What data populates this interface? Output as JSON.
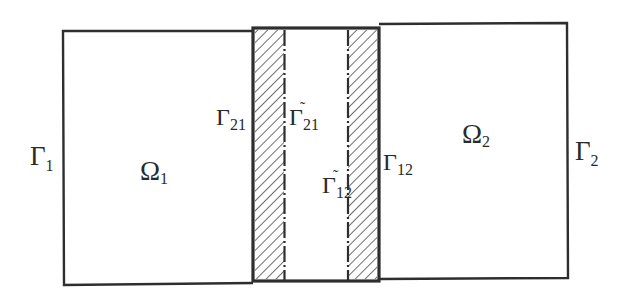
{
  "diagram": {
    "colors": {
      "stroke": "#2e2e2e",
      "hatch": "#4a4a4a",
      "background": "#ffffff",
      "text": "#2a2a2a"
    },
    "regions": {
      "omega1": {
        "symbol": "Ω",
        "subscript": "1"
      },
      "omega2": {
        "symbol": "Ω",
        "subscript": "2"
      }
    },
    "boundaries": {
      "gamma1": {
        "symbol": "Γ",
        "subscript": "1",
        "tilde": false
      },
      "gamma2": {
        "symbol": "Γ",
        "subscript": "2",
        "tilde": false
      },
      "gamma21": {
        "symbol": "Γ",
        "subscript": "21",
        "tilde": false
      },
      "gamma12": {
        "symbol": "Γ",
        "subscript": "12",
        "tilde": false
      },
      "gamma21_tilde": {
        "symbol": "Γ",
        "subscript": "21",
        "tilde": true,
        "mark": "˜"
      },
      "gamma12_tilde": {
        "symbol": "Γ",
        "subscript": "12",
        "tilde": true,
        "mark": "˜"
      }
    },
    "line_styles": {
      "interface_lines": "dash-dot",
      "overlap_fill": "diagonal-hatch"
    }
  }
}
